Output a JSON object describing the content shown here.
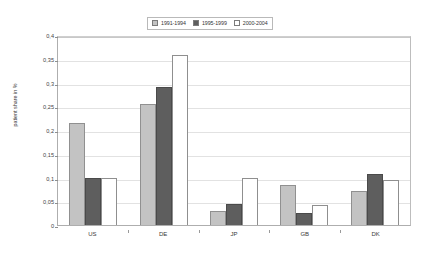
{
  "chart_data": {
    "type": "bar",
    "title": "",
    "xlabel": "",
    "ylabel": "patient share in %",
    "categories": [
      "US",
      "DE",
      "JP",
      "GB",
      "DK"
    ],
    "series": [
      {
        "name": "1991-1994",
        "color": "#c3c3c3",
        "values": [
          0.215,
          0.255,
          0.03,
          0.085,
          0.072
        ]
      },
      {
        "name": "1995-1999",
        "color": "#5e5e5e",
        "values": [
          0.1,
          0.29,
          0.045,
          0.025,
          0.107
        ]
      },
      {
        "name": "2000-2004",
        "color": "#ffffff",
        "values": [
          0.098,
          0.357,
          0.098,
          0.042,
          0.094
        ]
      }
    ],
    "ylim": [
      0,
      0.4
    ],
    "ytick_values": [
      0,
      0.05,
      0.1,
      0.15,
      0.2,
      0.25,
      0.3,
      0.35,
      0.4
    ],
    "ytick_labels": [
      "0",
      "0,05",
      "0,1",
      "0,15",
      "0,2",
      "0,25",
      "0,3",
      "0,35",
      "0,4"
    ],
    "grid": true,
    "legend_position": "top-center"
  },
  "legend": {
    "entries": [
      {
        "label": "1991-1994"
      },
      {
        "label": "1995-1999"
      },
      {
        "label": "2000-2004"
      }
    ]
  },
  "axis": {
    "y_title": "patient share in %"
  }
}
